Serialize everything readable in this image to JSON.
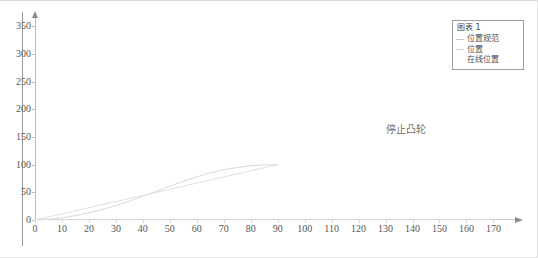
{
  "chart_data": {
    "type": "line",
    "title": "",
    "xlabel": "",
    "ylabel": "",
    "xlim": [
      0,
      178
    ],
    "ylim": [
      0,
      365
    ],
    "grid": false,
    "legend_position": "top-right",
    "x_ticks": [
      0,
      10,
      20,
      30,
      40,
      50,
      60,
      70,
      80,
      90,
      100,
      110,
      120,
      130,
      140,
      150,
      160,
      170
    ],
    "y_ticks": [
      0,
      50,
      100,
      150,
      200,
      250,
      300,
      350
    ],
    "annotations": [
      {
        "text": "停止凸轮",
        "x": 130,
        "y": 180
      }
    ],
    "series": [
      {
        "name": "位置规范",
        "color": "#d9d9d9",
        "x": [
          0,
          5,
          10,
          15,
          20,
          25,
          30,
          35,
          40,
          45,
          50,
          55,
          60,
          65,
          70,
          75,
          80,
          85,
          90
        ],
        "values": [
          0,
          1.5,
          4,
          8,
          13,
          19,
          26,
          34,
          43,
          52,
          61,
          70,
          78,
          85,
          91,
          95,
          98,
          99.5,
          100
        ]
      },
      {
        "name": "位置",
        "color": "#e0e0e0",
        "x": [
          0,
          90
        ],
        "values": [
          0,
          100
        ]
      },
      {
        "name": "在线位置",
        "color": "#ededed",
        "x": [
          0,
          170
        ],
        "values": [
          0,
          0
        ]
      }
    ]
  },
  "legend": {
    "title": "图表 1",
    "entries": [
      {
        "label": "位置规范",
        "marker": "line",
        "color": "#c9c9c9"
      },
      {
        "label": "位置",
        "marker": "line",
        "color": "#cfcfcf"
      },
      {
        "label": "在线位置",
        "marker": "none",
        "color": "#dddddd"
      }
    ]
  },
  "annotation": {
    "stop_cam": "停止凸轮"
  },
  "axes": {
    "y_tick_labels": [
      "350",
      "300",
      "250",
      "200",
      "150",
      "100",
      "50",
      "0"
    ],
    "x_tick_labels": [
      "0",
      "10",
      "20",
      "30",
      "40",
      "50",
      "60",
      "70",
      "80",
      "90",
      "100",
      "110",
      "120",
      "130",
      "140",
      "150",
      "160",
      "170"
    ]
  },
  "colors": {
    "axis": "#b9b9b9",
    "curve": "#d9d9d9",
    "text": "#555555",
    "frame": "#d8d8d8"
  }
}
